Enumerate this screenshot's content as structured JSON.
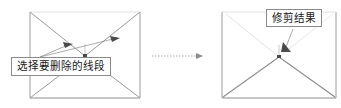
{
  "figure": {
    "title_visible": false,
    "background_color": "#ffffff",
    "line_color": "#8f8f8f",
    "dark_line_color": "#555555",
    "faint_line_color": "#c8c8c8",
    "text_color": "#1a1a1a",
    "box_border_color": "#8a8a8a"
  },
  "callouts": {
    "select_label": "选择要删除的线段",
    "result_label": "修剪结果"
  },
  "panels": {
    "before": {
      "name": "before-panel",
      "rect": {
        "x": 30,
        "y": 12,
        "w": 110,
        "h": 86
      }
    },
    "after": {
      "name": "after-panel",
      "rect": {
        "x": 222,
        "y": 12,
        "w": 114,
        "h": 86
      }
    }
  },
  "transition_arrow": {
    "name": "transition-arrow",
    "from_x": 152,
    "to_x": 200,
    "y": 56,
    "style": "dotted"
  },
  "markers": {
    "cursor_arrow_left_count": 2,
    "cursor_arrow_right_count": 1
  }
}
